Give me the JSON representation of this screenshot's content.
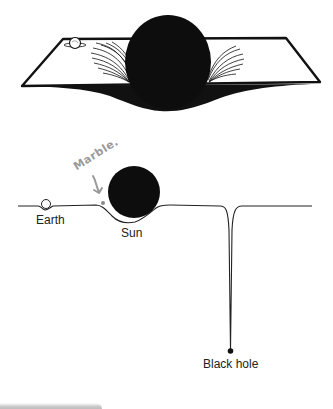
{
  "figure": {
    "top_panel": {
      "description": "3D rubber-sheet model: sun deforming a plane with Earth on the sheet",
      "objects": [
        "earth-marble",
        "sun-sphere",
        "warped-sheet"
      ]
    },
    "bottom_panel": {
      "description": "Cross-section of curved spacetime",
      "labels": {
        "earth": "Earth",
        "sun": "Sun",
        "black_hole": "Black hole"
      },
      "annotation": {
        "text": "Marble.",
        "arrow": "↓"
      }
    },
    "colors": {
      "ink": "#111111",
      "background": "#ffffff",
      "annotation": "#9a9a9a"
    }
  }
}
